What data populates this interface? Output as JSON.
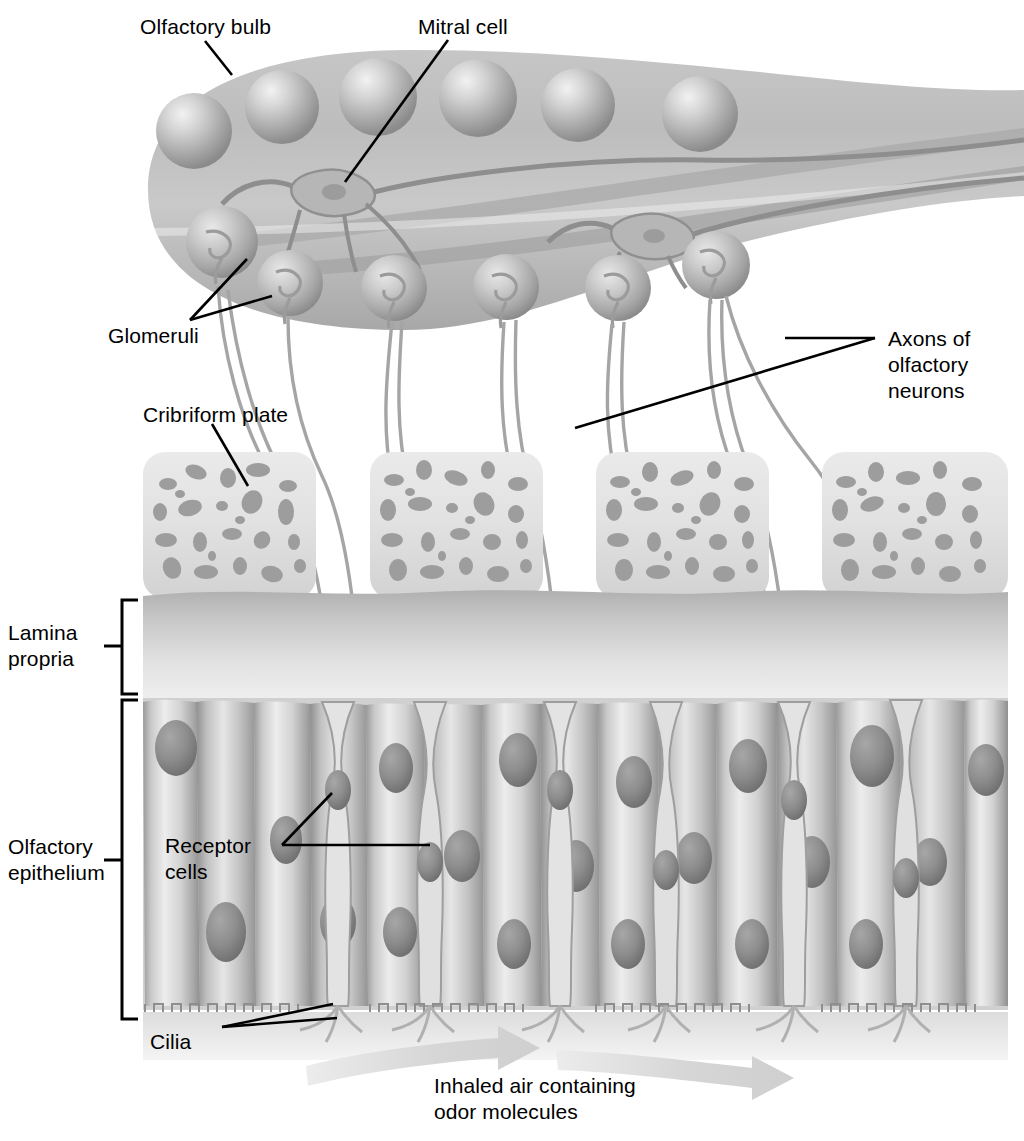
{
  "figure": {
    "domain": "anatomical-diagram",
    "palette": {
      "background": "#ffffff",
      "ink": "#000000",
      "bulb_light": "#cfcfcf",
      "bulb_mid": "#b4b4b4",
      "bulb_dark": "#9a9a9a",
      "glomerulus_light": "#d8d8d8",
      "glomerulus_dark": "#8f8f8f",
      "bone_fill": "#e2e2e2",
      "bone_pore": "#9d9d9d",
      "lamina_top": "#b9b9b9",
      "lamina_bottom": "#ededed",
      "epithelium_light": "#e8e8e8",
      "epithelium_mid": "#c3c3c3",
      "epithelium_dark": "#8d8d8d",
      "nucleus": "#8a8a8a",
      "axon_stroke": "#9e9e9e",
      "airflow_arrow": "#d9d9d9"
    }
  },
  "labels": {
    "olfactory_bulb": "Olfactory bulb",
    "mitral_cell": "Mitral cell",
    "glomeruli": "Glomeruli",
    "axons_line1": "Axons of",
    "axons_line2": "olfactory",
    "axons_line3": "neurons",
    "cribriform_plate": "Cribriform plate",
    "lamina_line1": "Lamina",
    "lamina_line2": "propria",
    "epithelium_line1": "Olfactory",
    "epithelium_line2": "epithelium",
    "receptor_line1": "Receptor",
    "receptor_line2": "cells",
    "cilia": "Cilia",
    "airflow_line1": "Inhaled air containing",
    "airflow_line2": "odor molecules"
  },
  "structures": {
    "olfactory_bulb": {
      "name": "olfactory bulb",
      "mitral_cell_bodies": 2,
      "upper_cell_spheres": 6,
      "glomeruli_count": 6
    },
    "cribriform_plate": {
      "name": "cribriform plate",
      "block_count": 4,
      "description": "perforated bone blocks with pores"
    },
    "lamina_propria": {
      "name": "lamina propria"
    },
    "olfactory_epithelium": {
      "name": "olfactory epithelium",
      "supporting_cells": 13,
      "receptor_cells": 7,
      "cilia_tufts": 7
    },
    "airflow": {
      "arrows": 2,
      "direction": "left-to-right"
    }
  },
  "brackets": {
    "lamina_propria": {
      "top": 600,
      "bottom": 694
    },
    "olfactory_epithelium": {
      "top": 700,
      "bottom": 1019
    }
  }
}
